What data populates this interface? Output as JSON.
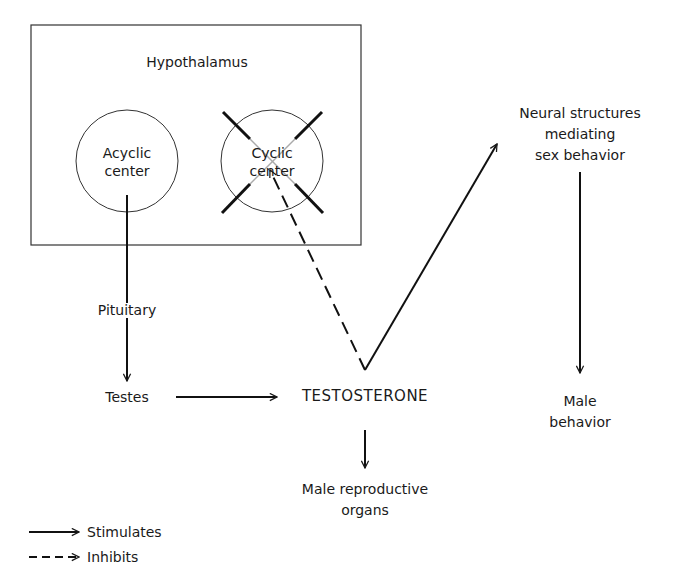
{
  "diagram": {
    "box_label": "Hypothalamus",
    "nodes": {
      "acyclic": "Acyclic\ncenter",
      "cyclic": "Cyclic\ncenter",
      "pituitary": "Pituitary",
      "testes": "Testes",
      "testosterone": "TESTOSTERONE",
      "neural": "Neural structures\nmediating\nsex behavior",
      "male_behavior": "Male\nbehavior",
      "male_organs": "Male reproductive\norgans"
    },
    "edges": [
      {
        "from": "Acyclic center",
        "to": "Pituitary",
        "type": "stimulates"
      },
      {
        "from": "Pituitary",
        "to": "Testes",
        "type": "stimulates"
      },
      {
        "from": "Testes",
        "to": "TESTOSTERONE",
        "type": "stimulates"
      },
      {
        "from": "TESTOSTERONE",
        "to": "Cyclic center",
        "type": "inhibits"
      },
      {
        "from": "TESTOSTERONE",
        "to": "Neural structures mediating sex behavior",
        "type": "stimulates"
      },
      {
        "from": "Neural structures mediating sex behavior",
        "to": "Male behavior",
        "type": "stimulates"
      },
      {
        "from": "TESTOSTERONE",
        "to": "Male reproductive organs",
        "type": "stimulates"
      }
    ],
    "cyclic_center_crossed_out": true
  },
  "legend": {
    "stimulates": "Stimulates",
    "inhibits": "Inhibits"
  }
}
